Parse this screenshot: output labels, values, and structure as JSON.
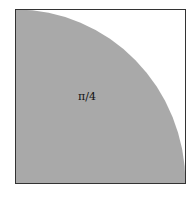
{
  "diagram": {
    "type": "quarter-circle-in-square",
    "label": "π/4",
    "colors": {
      "fill": "#a9a9a9",
      "border": "#333333",
      "background": "#ffffff"
    }
  }
}
